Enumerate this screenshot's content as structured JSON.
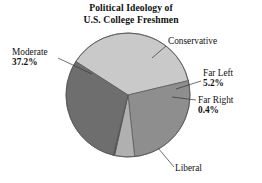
{
  "chart_data": {
    "type": "pie",
    "title": "Political Ideology of U.S. College Freshmen",
    "title_line1": "Political Ideology of",
    "title_line2": "U.S. College Freshmen",
    "xlabel": "",
    "ylabel": "",
    "legend": "none",
    "grid": false,
    "categories": [
      "Liberal",
      "Moderate",
      "Conservative",
      "Far Left",
      "Far Right"
    ],
    "values": [
      30.2,
      37.2,
      27.0,
      5.2,
      0.4
    ],
    "unit": "%",
    "slices": [
      {
        "name": "Liberal",
        "value": 30.2,
        "label": "Liberal",
        "percent_label": "",
        "show_percent": false,
        "color": "#6e6e6e",
        "start_angle_deg": 104.0,
        "end_angle_deg": 212.7
      },
      {
        "name": "Moderate",
        "value": 37.2,
        "label": "Moderate",
        "percent_label": "37.2%",
        "show_percent": true,
        "color": "#c9c9c9",
        "start_angle_deg": 212.7,
        "end_angle_deg": 360.0
      },
      {
        "name": "Conservative",
        "value": 27.0,
        "label": "Conservative",
        "percent_label": "",
        "show_percent": false,
        "color": "#8e8e8e",
        "start_angle_deg": 0.0,
        "end_angle_deg": 97.2
      },
      {
        "name": "Far Left",
        "value": 5.2,
        "label": "Far Left",
        "percent_label": "5.2%",
        "show_percent": true,
        "color": "#b0b0b0",
        "start_angle_deg": 97.2,
        "end_angle_deg": 101.9
      },
      {
        "name": "Far Right",
        "value": 0.4,
        "label": "Far Right",
        "percent_label": "0.4%",
        "show_percent": true,
        "color": "#4f4f4f",
        "start_angle_deg": 101.9,
        "end_angle_deg": 104.0
      }
    ],
    "geometry": {
      "center_x": 128,
      "center_y": 95,
      "radius": 62
    },
    "colors": {
      "background": "#ffffff",
      "outline": "#555555",
      "text": "#111111",
      "leader_line": "#333333"
    }
  }
}
